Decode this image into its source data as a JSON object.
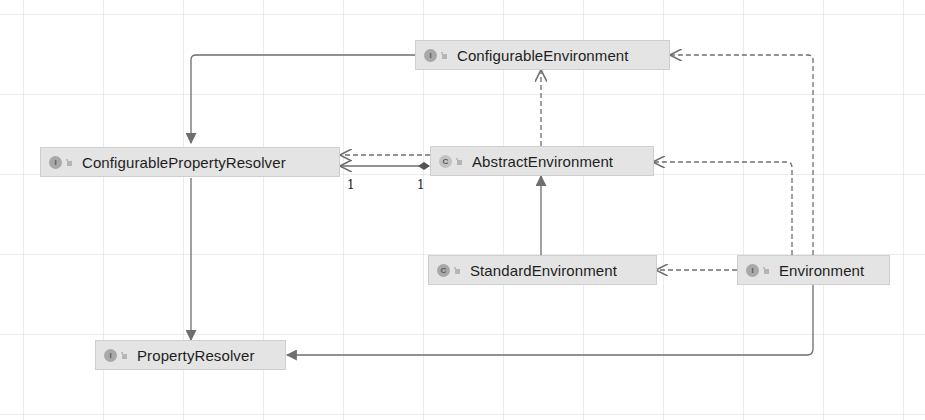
{
  "diagram": {
    "type": "uml-class-diagram",
    "colors": {
      "node_fill": "#e4e4e4",
      "node_border": "#cfcfcf",
      "edge": "#6e6e6e",
      "text": "#1e1e1e",
      "background": "#ffffff"
    },
    "nodes": [
      {
        "id": "configurable-environment",
        "label": "ConfigurableEnvironment",
        "kind": "interface",
        "kind_glyph": "I"
      },
      {
        "id": "configurable-property-resolver",
        "label": "ConfigurablePropertyResolver",
        "kind": "interface",
        "kind_glyph": "I"
      },
      {
        "id": "abstract-environment",
        "label": "AbstractEnvironment",
        "kind": "abstract-class",
        "kind_glyph": "C"
      },
      {
        "id": "standard-environment",
        "label": "StandardEnvironment",
        "kind": "class",
        "kind_glyph": "C"
      },
      {
        "id": "environment",
        "label": "Environment",
        "kind": "interface",
        "kind_glyph": "I"
      },
      {
        "id": "property-resolver",
        "label": "PropertyResolver",
        "kind": "interface",
        "kind_glyph": "I"
      }
    ],
    "edges": [
      {
        "from": "configurable-environment",
        "to": "configurable-property-resolver",
        "type": "extends",
        "style": "solid"
      },
      {
        "from": "abstract-environment",
        "to": "configurable-environment",
        "type": "implements",
        "style": "dashed"
      },
      {
        "from": "abstract-environment",
        "to": "configurable-property-resolver",
        "type": "implements",
        "style": "dashed"
      },
      {
        "from": "abstract-environment",
        "to": "configurable-property-resolver",
        "type": "composition",
        "style": "solid",
        "source_multiplicity": "1",
        "target_multiplicity": "1"
      },
      {
        "from": "standard-environment",
        "to": "abstract-environment",
        "type": "extends",
        "style": "solid"
      },
      {
        "from": "environment",
        "to": "standard-environment",
        "type": "implements",
        "style": "dashed"
      },
      {
        "from": "environment",
        "to": "abstract-environment",
        "type": "implements",
        "style": "dashed"
      },
      {
        "from": "environment",
        "to": "configurable-environment",
        "type": "implements",
        "style": "dashed"
      },
      {
        "from": "configurable-property-resolver",
        "to": "property-resolver",
        "type": "extends",
        "style": "solid"
      },
      {
        "from": "environment",
        "to": "property-resolver",
        "type": "extends",
        "style": "solid"
      }
    ],
    "multiplicities": {
      "target_end": "1",
      "source_end": "1"
    }
  }
}
